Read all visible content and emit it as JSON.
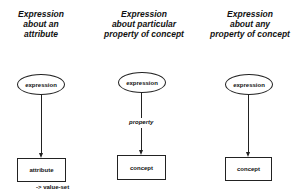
{
  "columns": [
    {
      "title_lines": [
        "Expression",
        "about an",
        "attribute"
      ],
      "node": "expression",
      "edge_label": "",
      "target": "attribute",
      "target_note": "-> value-set"
    },
    {
      "title_lines": [
        "Expression",
        "about particular",
        "property of concept"
      ],
      "node": "expression",
      "edge_label": "property",
      "target": "concept",
      "target_note": ""
    },
    {
      "title_lines": [
        "Expression",
        "about any",
        "property of concept"
      ],
      "node": "expression",
      "edge_label": "",
      "target": "concept",
      "target_note": ""
    }
  ]
}
